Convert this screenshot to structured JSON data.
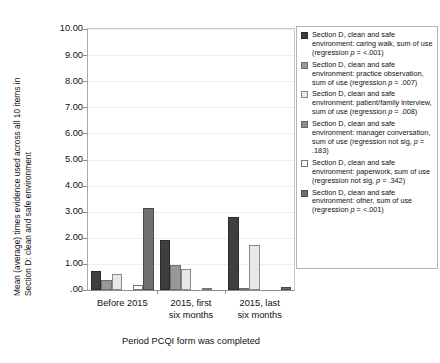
{
  "chart_data": {
    "type": "bar",
    "title": "",
    "subtitle": "",
    "xlabel": "Period PCQI form was completed",
    "ylabel": "Mean (average) times evidence used across all 10 items in Section D: clean and safe environment",
    "ylabel_line1": "Mean (average) times evidence used across all 10 items in",
    "ylabel_line2": "Section D: clean and safe environment",
    "ylim": [
      0,
      10
    ],
    "ytick_values": [
      10,
      9,
      8,
      7,
      6,
      5,
      4,
      3,
      2,
      1,
      0
    ],
    "ytick_labels": [
      "10.00",
      "9.00",
      "8.00",
      "7.00",
      "6.00",
      "5.00",
      "4.00",
      "3.00",
      "2.00",
      "1.00",
      ".00"
    ],
    "grid": true,
    "grid_axis": "y",
    "legend_position": "right",
    "categories": [
      "Before 2015",
      "2015, first six months",
      "2015, last six months"
    ],
    "category_lines": [
      [
        "Before 2015"
      ],
      [
        "2015, first",
        "six months"
      ],
      [
        "2015, last",
        "six months"
      ]
    ],
    "series": [
      {
        "name": "Section D, clean and safe environment: caring walk, sum of use (regression p = <.001)",
        "legend_text_plain": "Section D, clean and safe environment: caring walk, sum of use (regression ",
        "legend_italic": "p",
        "legend_text_tail": " = <.001)",
        "color": "#3f3f3f",
        "border": "#2a2a2a",
        "values": [
          0.72,
          1.9,
          2.8
        ]
      },
      {
        "name": "Section D, clean and safe environment: practice observation, sum of use (regression p = .007)",
        "legend_text_plain": "Section D, clean and safe environment: practice observation, sum of use (regression ",
        "legend_italic": "p",
        "legend_text_tail": " = .007)",
        "color": "#989898",
        "border": "#6f6f6f",
        "values": [
          0.4,
          0.97,
          0.08
        ]
      },
      {
        "name": "Section D, clean and safe environment: patient/family interview, sum of use (regression p = .008)",
        "legend_text_plain": "Section D, clean and safe environment: patient/family interview, sum of use (regression  ",
        "legend_italic": "p",
        "legend_text_tail": " = .008)",
        "color": "#e8e8e8",
        "border": "#8a8a8a",
        "values": [
          0.6,
          0.8,
          1.72
        ]
      },
      {
        "name": "Section D, clean and safe environment: manager conversation, sum of use (regression not sig, p = .183)",
        "legend_text_plain": "Section D, clean and safe environment: manager conversation, sum of use (regression not sig, ",
        "legend_italic": "p",
        "legend_text_tail": " = .183)",
        "color": "#8d8d8d",
        "border": "#666666",
        "values": [
          0.0,
          0.0,
          0.0
        ]
      },
      {
        "name": "Section D, clean and safe environment: paperwork, sum of use (regression not sig, p = .342)",
        "legend_text_plain": "Section D, clean and safe environment: paperwork, sum of use (regression not sig, ",
        "legend_italic": "p",
        "legend_text_tail": " = .342)",
        "color": "#fdfdfd",
        "border": "#767676",
        "values": [
          0.19,
          0.07,
          0.0
        ]
      },
      {
        "name": "Section D, clean and safe environment: other, sum of use (regression p = <.001)",
        "legend_text_plain": "Section D, clean and safe environment: other, sum of use (regression ",
        "legend_italic": "p",
        "legend_text_tail": " = <.001)",
        "color": "#707070",
        "border": "#4a4a4a",
        "values": [
          3.13,
          0.0,
          0.1
        ]
      }
    ]
  }
}
